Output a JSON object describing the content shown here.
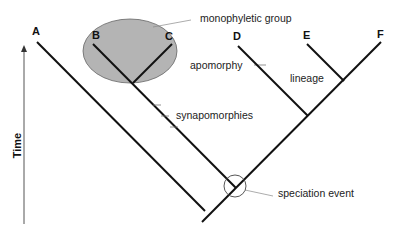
{
  "diagram": {
    "type": "cladogram",
    "taxa": [
      {
        "label": "A",
        "x": 37,
        "y": 40
      },
      {
        "label": "B",
        "x": 94,
        "y": 43
      },
      {
        "label": "C",
        "x": 170,
        "y": 43
      },
      {
        "label": "D",
        "x": 237,
        "y": 43
      },
      {
        "label": "E",
        "x": 307,
        "y": 43
      },
      {
        "label": "F",
        "x": 380,
        "y": 42
      }
    ],
    "annotations": {
      "monophyletic_group": "monophyletic group",
      "apomorphy": "apomorphy",
      "lineage": "lineage",
      "synapomorphies": "synapomorphies",
      "speciation_event": "speciation event"
    },
    "axis": {
      "label": "Time",
      "direction": "up"
    },
    "colors": {
      "line": "#111111",
      "ellipse_fill": "#b4b4b4",
      "ellipse_stroke": "#666666",
      "leader": "#888888"
    }
  }
}
